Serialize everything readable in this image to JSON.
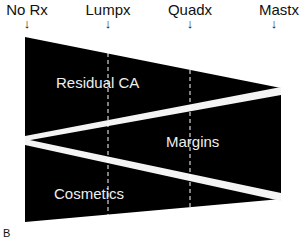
{
  "diagram": {
    "stages": [
      {
        "label": "No Rx",
        "arrow": "↓",
        "x": 25
      },
      {
        "label": "Lumpx",
        "arrow": "↓",
        "x": 108
      },
      {
        "label": "Quadx",
        "arrow": "↓",
        "x": 190
      },
      {
        "label": "Mastx",
        "arrow": "↓",
        "x": 272
      }
    ],
    "regions": [
      {
        "label": "Residual CA"
      },
      {
        "label": "Margins"
      },
      {
        "label": "Cosmetics"
      }
    ],
    "panel_letter": "B",
    "colors": {
      "fill": "#000000",
      "band": "#f4f4f4",
      "background": "#ffffff",
      "divider": "#ffffff"
    }
  }
}
